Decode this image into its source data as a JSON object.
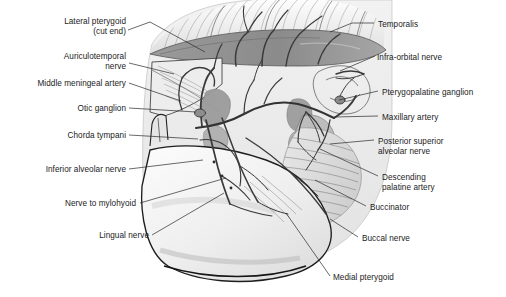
{
  "figure": {
    "style": "grayscale pencil anatomical illustration",
    "background_color": "#ffffff",
    "label_color": "#1b1b1b",
    "leader_color": "#2a2a2a"
  },
  "labels_left": [
    {
      "name": "lateral-pterygoid",
      "text": "Lateral pterygoid\n(cut end)",
      "x": 10,
      "y": 17,
      "w": 116,
      "align": "right"
    },
    {
      "name": "auriculotemporal-nerve",
      "text": "Auriculotemporal\nnerve",
      "x": 6,
      "y": 52,
      "w": 120,
      "align": "right"
    },
    {
      "name": "middle-meningeal-artery",
      "text": "Middle meningeal artery",
      "x": 6,
      "y": 79,
      "w": 120,
      "align": "right"
    },
    {
      "name": "otic-ganglion",
      "text": "Otic ganglion",
      "x": 6,
      "y": 104,
      "w": 120,
      "align": "right"
    },
    {
      "name": "chorda-tympani",
      "text": "Chorda tympani",
      "x": 6,
      "y": 131,
      "w": 120,
      "align": "right"
    },
    {
      "name": "inferior-alveolar-nerve",
      "text": "Inferior alveolar nerve",
      "x": 6,
      "y": 165,
      "w": 120,
      "align": "right"
    },
    {
      "name": "nerve-to-mylohyoid",
      "text": "Nerve to mylohyoid",
      "x": 6,
      "y": 199,
      "w": 130,
      "align": "right"
    },
    {
      "name": "lingual-nerve",
      "text": "Lingual nerve",
      "x": 6,
      "y": 231,
      "w": 143,
      "align": "right"
    }
  ],
  "labels_right": [
    {
      "name": "temporalis",
      "text": "Temporalis",
      "x": 378,
      "y": 20,
      "align": "left"
    },
    {
      "name": "infra-orbital-nerve",
      "text": "Infra-orbital nerve",
      "x": 377,
      "y": 53,
      "align": "left"
    },
    {
      "name": "pterygopalatine-ganglion",
      "text": "Pterygopalatine ganglion",
      "x": 382,
      "y": 88,
      "align": "left"
    },
    {
      "name": "maxillary-artery",
      "text": "Maxillary artery",
      "x": 382,
      "y": 113,
      "align": "left"
    },
    {
      "name": "posterior-superior-alveolar-nerve",
      "text": "Posterior superior\nalveolar nerve",
      "x": 378,
      "y": 137,
      "align": "left"
    },
    {
      "name": "descending-palatine-artery",
      "text": "Descending\npalatine artery",
      "x": 382,
      "y": 173,
      "align": "left"
    },
    {
      "name": "buccinator",
      "text": "Buccinator",
      "x": 370,
      "y": 203,
      "align": "left"
    },
    {
      "name": "buccal-nerve",
      "text": "Buccal nerve",
      "x": 362,
      "y": 234,
      "align": "left"
    },
    {
      "name": "medial-pterygoid",
      "text": "Medial pterygoid",
      "x": 333,
      "y": 273,
      "align": "left"
    }
  ],
  "leaders": [
    {
      "name": "leader-lateral-pterygoid",
      "d": "M128,30 L150,22 L205,52"
    },
    {
      "name": "leader-auriculotemporal-nerve",
      "d": "M129,63 L174,74"
    },
    {
      "name": "leader-middle-meningeal-artery",
      "d": "M129,83 L181,101"
    },
    {
      "name": "leader-otic-ganglion",
      "d": "M129,108 L196,112"
    },
    {
      "name": "leader-chorda-tympani",
      "d": "M129,135 L198,139"
    },
    {
      "name": "leader-inferior-alveolar-nerve",
      "d": "M129,169 L203,160"
    },
    {
      "name": "leader-nerve-to-mylohyoid",
      "d": "M140,203 L226,178"
    },
    {
      "name": "leader-lingual-nerve",
      "d": "M152,235 L224,193"
    },
    {
      "name": "leader-temporalis",
      "d": "M374,23 L352,23 L330,32"
    },
    {
      "name": "leader-infra-orbital-nerve",
      "d": "M375,56 L340,71"
    },
    {
      "name": "leader-pterygopalatine-ganglion",
      "d": "M378,91 L339,100"
    },
    {
      "name": "leader-maxillary-artery",
      "d": "M378,116 L334,117"
    },
    {
      "name": "leader-posterior-superior-alveolar-nerve",
      "d": "M374,140 L330,144"
    },
    {
      "name": "leader-descending-palatine-artery",
      "d": "M378,176 L320,149"
    },
    {
      "name": "leader-buccinator",
      "d": "M366,206 L315,180"
    },
    {
      "name": "leader-buccal-nerve",
      "d": "M358,237 L330,219"
    },
    {
      "name": "leader-medial-pterygoid",
      "d": "M330,276 L286,213"
    }
  ]
}
